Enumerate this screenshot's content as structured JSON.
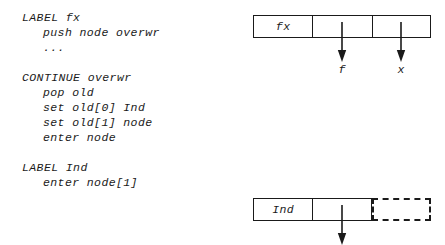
{
  "figure": {
    "type": "diagram",
    "kind": "pseudo-code-with-memory-cells",
    "background_color": "#ffffff",
    "stroke_color": "#1a1a1a"
  },
  "code": {
    "blocks": [
      {
        "name": "label-fx-block",
        "lines": [
          {
            "text": "LABEL fx",
            "indent": false
          },
          {
            "text": "push node overwr",
            "indent": true
          },
          {
            "text": "...",
            "indent": true
          }
        ]
      },
      {
        "name": "continue-overwr-block",
        "lines": [
          {
            "text": "CONTINUE overwr",
            "indent": false
          },
          {
            "text": "pop old",
            "indent": true
          },
          {
            "text": "set old[0] Ind",
            "indent": true
          },
          {
            "text": "set old[1] node",
            "indent": true
          },
          {
            "text": "enter node",
            "indent": true
          }
        ]
      },
      {
        "name": "label-ind-block",
        "lines": [
          {
            "text": "LABEL Ind",
            "indent": false
          },
          {
            "text": "enter node[1]",
            "indent": true
          }
        ]
      }
    ]
  },
  "diagrams": [
    {
      "name": "fx-node-diagram",
      "cells": [
        {
          "label": "fx",
          "style": "solid"
        },
        {
          "label": "",
          "style": "solid"
        },
        {
          "label": "",
          "style": "solid"
        }
      ],
      "arrows": [
        {
          "name": "arrow-f",
          "label": "f",
          "cell_index": 1
        },
        {
          "name": "arrow-x",
          "label": "x",
          "cell_index": 2
        }
      ]
    },
    {
      "name": "ind-node-diagram",
      "cells": [
        {
          "label": "Ind",
          "style": "solid"
        },
        {
          "label": "",
          "style": "solid"
        },
        {
          "label": "",
          "style": "dashed"
        }
      ],
      "arrows": [
        {
          "name": "arrow-ind-slot",
          "label": "",
          "cell_index": 1
        }
      ]
    }
  ]
}
